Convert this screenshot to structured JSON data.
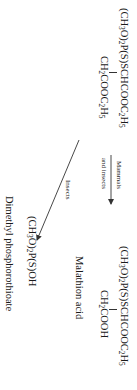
{
  "diagram": {
    "reactant": {
      "name": "Malathion",
      "line1": [
        "(CH",
        "3",
        "O)",
        "2",
        "P(S)SCHCOOC",
        "2",
        "H",
        "5"
      ],
      "line2": [
        "CH",
        "2",
        "COOC",
        "2",
        "H",
        "5"
      ]
    },
    "pathway_mammals": {
      "label_top": "Mammals",
      "label_bottom": "and insects"
    },
    "pathway_insects": {
      "label": "Insects"
    },
    "product_acid": {
      "line1": [
        "(CH",
        "3",
        "O)",
        "2",
        "P(S)SCHCOOC",
        "2",
        "H",
        "5"
      ],
      "line2": [
        "CH",
        "2",
        "COOH"
      ],
      "name": "Malathion acid"
    },
    "product_phosphorothioate": {
      "formula": [
        "(CH",
        "3",
        "O)",
        "2",
        "P(S)OH"
      ],
      "name": "Dimethyl phosphorothioate"
    },
    "colors": {
      "ink": "#1a1a1a",
      "arrow": "#333333",
      "background": "#ffffff"
    }
  }
}
